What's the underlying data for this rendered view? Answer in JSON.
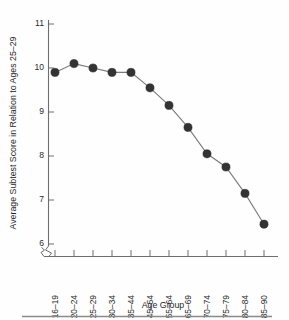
{
  "chart_data": {
    "type": "line",
    "title": "",
    "xlabel": "Age Group",
    "ylabel": "Average Subtest Score in Relation to Ages 25–29",
    "categories": [
      "16–19",
      "20–24",
      "25–29",
      "30–34",
      "35–44",
      "45–54",
      "55–64",
      "65–69",
      "70–74",
      "75–79",
      "80–84",
      "85–90"
    ],
    "values": [
      9.9,
      10.1,
      10.0,
      9.9,
      9.9,
      9.55,
      9.15,
      8.65,
      8.05,
      7.75,
      7.15,
      6.45
    ],
    "ylim": [
      6,
      11
    ],
    "yticks": [
      6,
      7,
      8,
      9,
      10,
      11
    ],
    "ytick_labels": [
      "6",
      "7",
      "8",
      "9",
      "10",
      "11"
    ],
    "grid": false,
    "legend": false,
    "legend_position": "none",
    "y_axis_break": true,
    "x_axis_break": true,
    "marker": "filled-circle",
    "colors": {
      "marker": "#333333",
      "line": "#7a7a7a",
      "axis": "#6e6e6e",
      "text": "#1f1f1f",
      "background": "#fefefe",
      "footer_rule": "#8a8a8a"
    }
  },
  "figure": {
    "footer_rule_present": true
  }
}
